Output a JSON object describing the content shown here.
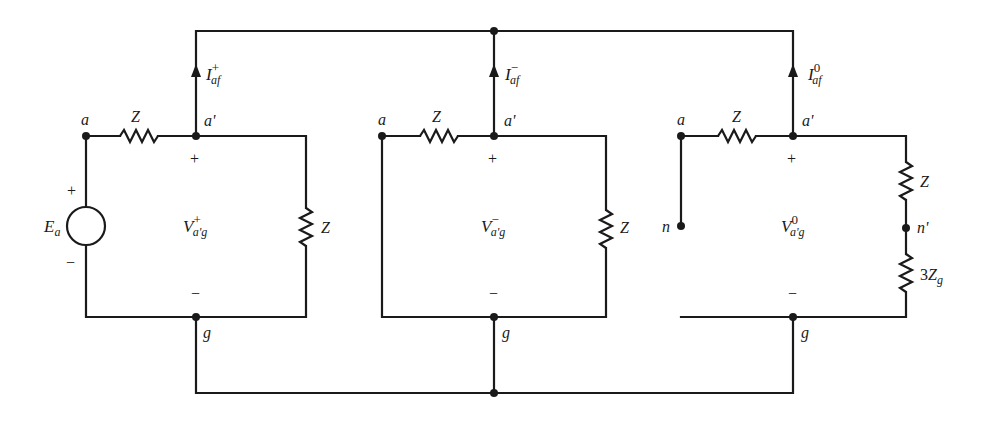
{
  "figure": {
    "colors": {
      "ink": "#1a1a1a",
      "background": "#ffffff"
    }
  },
  "networks": [
    {
      "id": "positive",
      "node_a": "a",
      "node_a_prime": "a'",
      "node_g": "g",
      "series_impedance": "Z",
      "shunt_impedance": "Z",
      "source": {
        "label": "E",
        "subscript": "a",
        "plus": "+",
        "minus": "−"
      },
      "voltage": {
        "base": "V",
        "superscript": "+",
        "subscript": "a'g"
      },
      "current": {
        "base": "I",
        "superscript": "+",
        "subscript": "af"
      },
      "plus_sign": "+",
      "minus_sign": "−"
    },
    {
      "id": "negative",
      "node_a": "a",
      "node_a_prime": "a'",
      "node_g": "g",
      "series_impedance": "Z",
      "shunt_impedance": "Z",
      "voltage": {
        "base": "V",
        "superscript": "−",
        "subscript": "a'g"
      },
      "current": {
        "base": "I",
        "superscript": "−",
        "subscript": "af"
      },
      "plus_sign": "+",
      "minus_sign": "−"
    },
    {
      "id": "zero",
      "node_a": "a",
      "node_a_prime": "a'",
      "node_g": "g",
      "node_n": "n",
      "node_n_prime": "n'",
      "series_impedance": "Z",
      "shunt_impedance": "Z",
      "ground_impedance": {
        "coef": "3",
        "base": "Z",
        "subscript": "g"
      },
      "voltage": {
        "base": "V",
        "superscript": "0",
        "subscript": "a'g"
      },
      "current": {
        "base": "I",
        "superscript": "0",
        "subscript": "af"
      },
      "plus_sign": "+",
      "minus_sign": "−"
    }
  ]
}
